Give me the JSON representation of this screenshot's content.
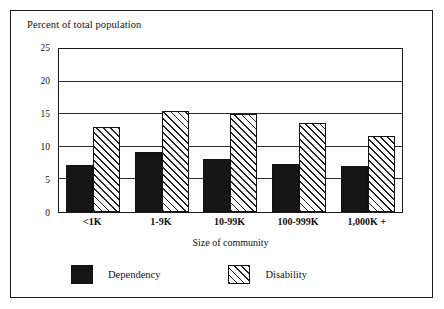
{
  "chart_data": {
    "type": "bar",
    "title": "Percent of total population",
    "subtitle": "",
    "xlabel": "Size of community",
    "ylabel": "Percent of total population",
    "categories": [
      "<1K",
      "1-9K",
      "10-99K",
      "100-999K",
      "1,000K +"
    ],
    "series": [
      {
        "name": "Dependency",
        "values": [
          7.2,
          9.2,
          8.2,
          7.4,
          7.1
        ],
        "color": "#151515",
        "fill": "solid"
      },
      {
        "name": "Disability",
        "values": [
          13.1,
          15.5,
          15.0,
          13.6,
          11.7
        ],
        "color": "#ffffff",
        "fill": "diagonal-hatch"
      }
    ],
    "ylim": [
      0,
      25
    ],
    "yticks": [
      0,
      5,
      10,
      15,
      20,
      25
    ],
    "ytick_labels": [
      "0",
      "5",
      "10",
      "15",
      "20",
      "25"
    ],
    "grid": "horizontal",
    "legend_position": "bottom-left"
  },
  "legend": {
    "items": [
      {
        "label": "Dependency"
      },
      {
        "label": "Disability"
      }
    ]
  }
}
